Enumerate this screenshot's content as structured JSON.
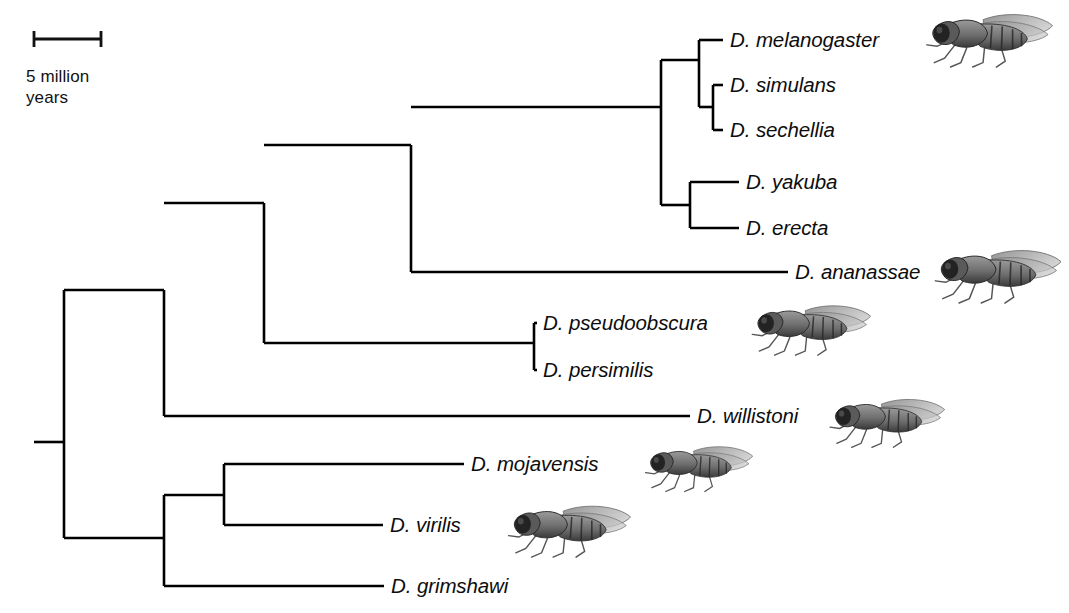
{
  "figure": {
    "type": "phylogenetic-tree",
    "background_color": "#ffffff",
    "line_color": "#000000"
  },
  "scale_bar": {
    "label": "5 million\nyears",
    "label_line1": "5 million",
    "label_line2": "years",
    "units": "million years",
    "value": 5,
    "x_start_px": 34,
    "x_end_px": 101,
    "y_px": 39
  },
  "tips": [
    {
      "id": "melanogaster",
      "label": "D. melanogaster",
      "label_x": 730,
      "y": 40,
      "branch_from_x": 699,
      "branch_to_x": 723,
      "has_fly": true
    },
    {
      "id": "simulans",
      "label": "D. simulans",
      "label_x": 730,
      "y": 85,
      "branch_from_x": 713,
      "branch_to_x": 723,
      "has_fly": false
    },
    {
      "id": "sechellia",
      "label": "D. sechellia",
      "label_x": 730,
      "y": 130,
      "branch_from_x": 713,
      "branch_to_x": 723,
      "has_fly": false
    },
    {
      "id": "yakuba",
      "label": "D. yakuba",
      "label_x": 746,
      "y": 182,
      "branch_from_x": 690,
      "branch_to_x": 739,
      "has_fly": false
    },
    {
      "id": "erecta",
      "label": "D. erecta",
      "label_x": 746,
      "y": 228,
      "branch_from_x": 690,
      "branch_to_x": 739,
      "has_fly": false
    },
    {
      "id": "ananassae",
      "label": "D. ananassae",
      "label_x": 795,
      "y": 272,
      "branch_from_x": 411,
      "branch_to_x": 788,
      "has_fly": true
    },
    {
      "id": "pseudoobscura",
      "label": "D. pseudoobscura",
      "label_x": 543,
      "y": 323,
      "branch_from_x": 534,
      "branch_to_x": 537,
      "has_fly": true
    },
    {
      "id": "persimilis",
      "label": "D. persimilis",
      "label_x": 543,
      "y": 370,
      "branch_from_x": 534,
      "branch_to_x": 537,
      "has_fly": false
    },
    {
      "id": "willistoni",
      "label": "D. willistoni",
      "label_x": 697,
      "y": 416,
      "branch_from_x": 164,
      "branch_to_x": 690,
      "has_fly": true
    },
    {
      "id": "mojavensis",
      "label": "D. mojavensis",
      "label_x": 471,
      "y": 464,
      "branch_from_x": 224,
      "branch_to_x": 464,
      "has_fly": true
    },
    {
      "id": "virilis",
      "label": "D. virilis",
      "label_x": 390,
      "y": 525,
      "branch_from_x": 224,
      "branch_to_x": 383,
      "has_fly": true
    },
    {
      "id": "grimshawi",
      "label": "D. grimshawi",
      "label_x": 391,
      "y": 586,
      "branch_from_x": 164,
      "branch_to_x": 384,
      "has_fly": false
    }
  ],
  "nodes": [
    {
      "id": "root",
      "x": 64,
      "y_top": 290,
      "y_bottom": 538,
      "stub_from_x": 34,
      "stub_y": 442
    },
    {
      "id": "sophophora",
      "x": 164,
      "y_top": 290,
      "y_bottom": 416
    },
    {
      "id": "melano-obscura",
      "x": 264,
      "y_top": 203,
      "y_bottom": 343
    },
    {
      "id": "melanogaster-grp",
      "x": 411,
      "y_top": 145,
      "y_bottom": 272
    },
    {
      "id": "mel-subgroup",
      "x": 661,
      "y_top": 60,
      "y_bottom": 205
    },
    {
      "id": "mel-sim-sech",
      "x": 699,
      "y_top": 40,
      "y_bottom": 107
    },
    {
      "id": "sim-sech",
      "x": 713,
      "y_top": 85,
      "y_bottom": 130
    },
    {
      "id": "yak-ere",
      "x": 690,
      "y_top": 182,
      "y_bottom": 228
    },
    {
      "id": "obscura-grp",
      "x": 534,
      "y_top": 323,
      "y_bottom": 370
    },
    {
      "id": "drosophila-sub",
      "x": 164,
      "y_top": 495,
      "y_bottom": 586
    },
    {
      "id": "mojav-virilis",
      "x": 224,
      "y_top": 464,
      "y_bottom": 525
    }
  ],
  "connectors": [
    {
      "from_x": 64,
      "to_x": 164,
      "y": 290,
      "name": "root-to-sophophora"
    },
    {
      "from_x": 64,
      "to_x": 164,
      "y": 538,
      "name": "root-to-drosophila"
    },
    {
      "from_x": 164,
      "to_x": 264,
      "y": 203,
      "name": "sophophora-to-melano-obscura"
    },
    {
      "from_x": 264,
      "to_x": 411,
      "y": 145,
      "name": "to-melanogaster-group"
    },
    {
      "from_x": 264,
      "to_x": 534,
      "y": 343,
      "name": "to-obscura-group"
    },
    {
      "from_x": 411,
      "to_x": 661,
      "y": 107,
      "name": "to-mel-subgroup"
    },
    {
      "from_x": 661,
      "to_x": 699,
      "y": 60,
      "name": "to-mel-sim-sech"
    },
    {
      "from_x": 661,
      "to_x": 690,
      "y": 205,
      "name": "to-yak-ere"
    },
    {
      "from_x": 699,
      "to_x": 713,
      "y": 107,
      "name": "to-sim-sech"
    },
    {
      "from_x": 164,
      "to_x": 224,
      "y": 495,
      "name": "to-mojav-virilis"
    }
  ],
  "fly_illustrations": [
    {
      "for": "melanogaster",
      "x": 903,
      "y": 2,
      "w": 166,
      "h": 68,
      "name": "fly-melanogaster"
    },
    {
      "for": "ananassae",
      "x": 920,
      "y": 238,
      "w": 149,
      "h": 68,
      "name": "fly-ananassae"
    },
    {
      "for": "pseudoobscura",
      "x": 734,
      "y": 294,
      "w": 148,
      "h": 64,
      "name": "fly-pseudoobscura"
    },
    {
      "for": "willistoni",
      "x": 813,
      "y": 388,
      "w": 142,
      "h": 62,
      "name": "fly-willistoni"
    },
    {
      "for": "mojavensis",
      "x": 632,
      "y": 436,
      "w": 128,
      "h": 58,
      "name": "fly-mojavensis"
    },
    {
      "for": "virilis",
      "x": 490,
      "y": 494,
      "w": 152,
      "h": 66,
      "name": "fly-virilis"
    }
  ]
}
